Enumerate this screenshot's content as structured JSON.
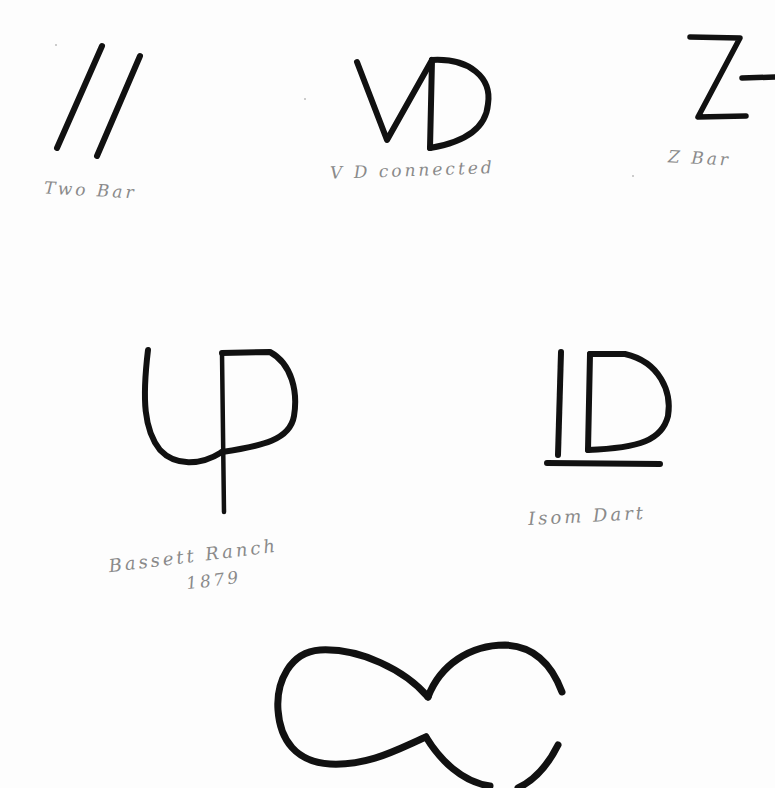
{
  "page": {
    "ink_color": "#111111",
    "label_color": "#8a8a8a",
    "background": "#fdfdfd"
  },
  "brands": [
    {
      "id": "two-bar",
      "glyph": "//",
      "label": "Two Bar"
    },
    {
      "id": "vd-connected",
      "glyph": "VD",
      "label": "V D connected"
    },
    {
      "id": "z-bar",
      "glyph": "Z-",
      "label": "Z Bar"
    },
    {
      "id": "bassett-ranch",
      "glyph": "UP",
      "label": "Bassett Ranch",
      "year": "1879"
    },
    {
      "id": "isom-dart",
      "glyph": "ID",
      "label": "Isom Dart"
    },
    {
      "id": "hog-eye",
      "glyph": "∞"
    }
  ]
}
